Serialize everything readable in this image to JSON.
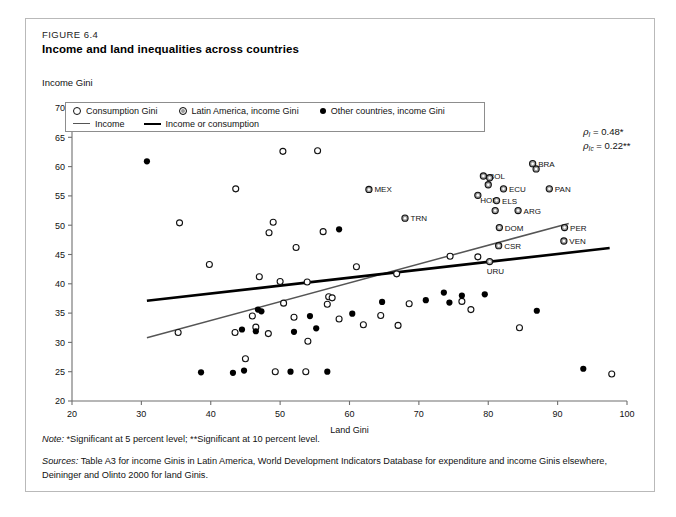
{
  "figure": {
    "number": "FIGURE 6.4",
    "title": "Income and land inequalities across countries"
  },
  "legend": {
    "items": [
      {
        "marker": "open-circle",
        "label": "Consumption Gini"
      },
      {
        "marker": "latin-america-circle",
        "label": "Latin America, income Gini"
      },
      {
        "marker": "solid-circle",
        "label": "Other countries, income Gini"
      },
      {
        "marker": "thin-line",
        "label": "Income"
      },
      {
        "marker": "thick-line",
        "label": "Income or consumption"
      }
    ]
  },
  "annotations": {
    "rho_income": {
      "symbol": "ρ",
      "subscript": "I",
      "equals": "=",
      "value": "0.48*"
    },
    "rho_income_consumption": {
      "symbol": "ρ",
      "subscript": "Ic",
      "equals": "=",
      "value": "0.22**"
    }
  },
  "notes": {
    "note_label": "Note:",
    "note_text": "*Significant at 5 percent level; **Significant at 10 percent level.",
    "sources_label": "Sources:",
    "sources_text_line1": "Table A3 for income Ginis in Latin America, World Development Indicators Database for expenditure and income Ginis elsewhere,",
    "sources_text_line2": "Deininger and Olinto 2000 for land Ginis."
  },
  "chart_data": {
    "type": "scatter",
    "title": "Income and land inequalities across countries",
    "xlabel": "Land Gini",
    "ylabel": "Income Gini",
    "xlim": [
      20,
      100
    ],
    "ylim": [
      20,
      70
    ],
    "xticks": [
      20,
      30,
      40,
      50,
      60,
      70,
      80,
      90,
      100
    ],
    "yticks": [
      20,
      25,
      30,
      35,
      40,
      45,
      50,
      55,
      60,
      65,
      70
    ],
    "grid": false,
    "legend_position": "top-left-inside",
    "series": [
      {
        "name": "Latin America, income Gini",
        "marker": "latin-america-circle",
        "labeled": true,
        "points": [
          {
            "x": 62.8,
            "y": 56.1,
            "label": "MEX"
          },
          {
            "x": 68.0,
            "y": 51.2,
            "label": "TRN"
          },
          {
            "x": 79.3,
            "y": 58.4,
            "label": "BOL"
          },
          {
            "x": 80.2,
            "y": 58.1,
            "label": "BOL2"
          },
          {
            "x": 80.0,
            "y": 56.9,
            "label": "BOL3"
          },
          {
            "x": 86.4,
            "y": 60.5,
            "label": "BRA"
          },
          {
            "x": 86.9,
            "y": 59.6,
            "label": "BRA2"
          },
          {
            "x": 82.2,
            "y": 56.2,
            "label": "ECU"
          },
          {
            "x": 88.8,
            "y": 56.2,
            "label": "PAN"
          },
          {
            "x": 78.5,
            "y": 55.1,
            "label": "HON"
          },
          {
            "x": 81.2,
            "y": 54.2,
            "label": "ELS"
          },
          {
            "x": 81.0,
            "y": 52.5,
            "label": "ELS2"
          },
          {
            "x": 84.3,
            "y": 52.5,
            "label": "ARG"
          },
          {
            "x": 81.6,
            "y": 49.6,
            "label": "DOM"
          },
          {
            "x": 91.0,
            "y": 49.6,
            "label": "PER"
          },
          {
            "x": 90.9,
            "y": 47.3,
            "label": "VEN"
          },
          {
            "x": 81.5,
            "y": 46.5,
            "label": "CSR"
          },
          {
            "x": 80.2,
            "y": 43.8,
            "label": "URU"
          }
        ]
      },
      {
        "name": "Consumption Gini",
        "marker": "open-circle",
        "points": [
          {
            "x": 35.5,
            "y": 50.4
          },
          {
            "x": 39.8,
            "y": 43.3
          },
          {
            "x": 43.6,
            "y": 56.2
          },
          {
            "x": 50.4,
            "y": 62.6
          },
          {
            "x": 55.4,
            "y": 62.7
          },
          {
            "x": 49.0,
            "y": 50.5
          },
          {
            "x": 56.2,
            "y": 48.9
          },
          {
            "x": 48.4,
            "y": 48.7
          },
          {
            "x": 52.3,
            "y": 46.2
          },
          {
            "x": 47.0,
            "y": 41.2
          },
          {
            "x": 50.0,
            "y": 40.4
          },
          {
            "x": 53.9,
            "y": 40.3
          },
          {
            "x": 61.0,
            "y": 42.9
          },
          {
            "x": 66.8,
            "y": 41.7
          },
          {
            "x": 35.3,
            "y": 31.7
          },
          {
            "x": 43.5,
            "y": 31.7
          },
          {
            "x": 46.0,
            "y": 34.5
          },
          {
            "x": 46.5,
            "y": 32.6
          },
          {
            "x": 48.3,
            "y": 31.5
          },
          {
            "x": 50.5,
            "y": 36.7
          },
          {
            "x": 52.0,
            "y": 34.3
          },
          {
            "x": 57.0,
            "y": 37.8
          },
          {
            "x": 57.5,
            "y": 37.6
          },
          {
            "x": 56.8,
            "y": 36.5
          },
          {
            "x": 54.0,
            "y": 30.2
          },
          {
            "x": 45.0,
            "y": 27.2
          },
          {
            "x": 49.3,
            "y": 25.0
          },
          {
            "x": 53.7,
            "y": 25.0
          },
          {
            "x": 64.5,
            "y": 34.6
          },
          {
            "x": 62.0,
            "y": 33.0
          },
          {
            "x": 67.0,
            "y": 32.9
          },
          {
            "x": 68.6,
            "y": 36.6
          },
          {
            "x": 74.5,
            "y": 44.7
          },
          {
            "x": 78.5,
            "y": 44.6
          },
          {
            "x": 76.2,
            "y": 37.0
          },
          {
            "x": 77.5,
            "y": 35.6
          },
          {
            "x": 84.5,
            "y": 32.5
          },
          {
            "x": 97.8,
            "y": 24.6
          },
          {
            "x": 58.5,
            "y": 34.0
          }
        ]
      },
      {
        "name": "Other countries, income Gini",
        "marker": "solid-circle",
        "points": [
          {
            "x": 30.8,
            "y": 60.9
          },
          {
            "x": 58.5,
            "y": 49.3
          },
          {
            "x": 46.8,
            "y": 35.6
          },
          {
            "x": 47.3,
            "y": 35.3
          },
          {
            "x": 44.5,
            "y": 32.2
          },
          {
            "x": 46.5,
            "y": 31.9
          },
          {
            "x": 52.0,
            "y": 31.8
          },
          {
            "x": 55.2,
            "y": 32.4
          },
          {
            "x": 54.3,
            "y": 34.5
          },
          {
            "x": 60.4,
            "y": 34.9
          },
          {
            "x": 64.7,
            "y": 36.9
          },
          {
            "x": 38.6,
            "y": 24.9
          },
          {
            "x": 43.2,
            "y": 24.8
          },
          {
            "x": 44.8,
            "y": 25.2
          },
          {
            "x": 51.5,
            "y": 25.0
          },
          {
            "x": 56.8,
            "y": 25.0
          },
          {
            "x": 73.6,
            "y": 38.5
          },
          {
            "x": 71.0,
            "y": 37.2
          },
          {
            "x": 74.4,
            "y": 36.8
          },
          {
            "x": 76.2,
            "y": 38.0
          },
          {
            "x": 79.5,
            "y": 38.2
          },
          {
            "x": 87.0,
            "y": 35.4
          },
          {
            "x": 93.7,
            "y": 25.5
          }
        ]
      }
    ],
    "trendlines": [
      {
        "name": "Income",
        "style": "thin",
        "color": "#555555",
        "x1": 30.8,
        "y1": 30.8,
        "x2": 91.6,
        "y2": 50.3
      },
      {
        "name": "Income or consumption",
        "style": "thick",
        "color": "#000000",
        "x1": 30.8,
        "y1": 37.1,
        "x2": 97.5,
        "y2": 46.1
      }
    ]
  }
}
